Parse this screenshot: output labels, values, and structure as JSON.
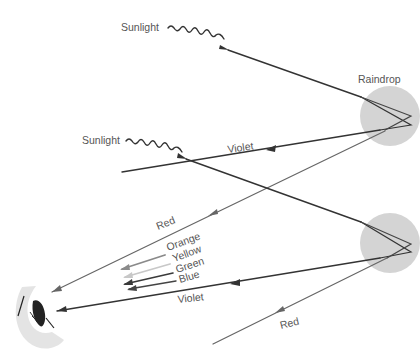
{
  "diagram": {
    "labels": {
      "sunlight_top": "Sunlight",
      "sunlight_mid": "Sunlight",
      "raindrop": "Raindrop",
      "violet_upper": "Violet",
      "red_upper": "Red",
      "orange": "Orange",
      "yellow": "Yellow",
      "green": "Green",
      "blue": "Blue",
      "violet_lower": "Violet",
      "red_lower": "Red"
    },
    "colors": {
      "raindrop_fill": "#d4d4d4",
      "ray_dark": "#333333",
      "ray_red": "#666666",
      "orange": "#8a8a8a",
      "yellow": "#c8c8c8",
      "green": "#3a3a3a",
      "blue": "#444444",
      "eye_skin": "#e4e4e4",
      "label": "#555555"
    }
  }
}
